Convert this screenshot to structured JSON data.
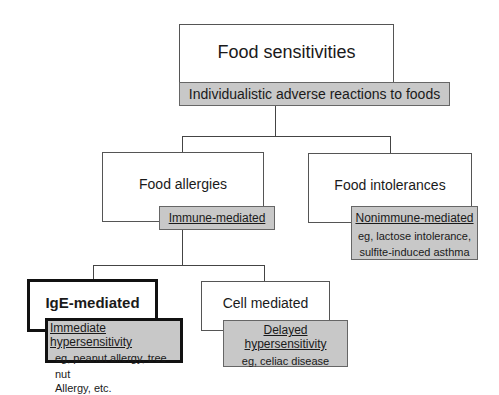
{
  "root": {
    "title": "Food sensitivities",
    "label": "Individualistic adverse reactions to foods"
  },
  "allergies": {
    "title": "Food allergies",
    "label": "Immune-mediated"
  },
  "intolerances": {
    "title": "Food intolerances",
    "label": "Nonimmune-mediated",
    "detail_1": "eg, lactose intolerance,",
    "detail_2": "sulfite-induced asthma"
  },
  "ige": {
    "title": "IgE-mediated",
    "label": "Immediate hypersensitivity",
    "detail_1": "eg, peanut allergy, tree nut",
    "detail_2": "Allergy, etc."
  },
  "cell": {
    "title": "Cell mediated",
    "label": "Delayed hypersensitivity",
    "detail_1": "eg, celiac disease"
  }
}
